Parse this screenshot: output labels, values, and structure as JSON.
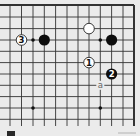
{
  "diagram": {
    "type": "go-board-fragment",
    "corner": "top-right",
    "grid": {
      "columns_x": [
        10,
        21.5,
        33,
        44.3,
        55.6,
        67,
        78,
        89,
        100.3,
        111.6,
        123,
        134
      ],
      "rows_y": [
        5,
        17,
        28.6,
        40,
        51.3,
        62.6,
        74,
        85.3,
        96.6,
        108,
        119.3
      ],
      "edge_top": true,
      "edge_right": true,
      "line_color": "#333333",
      "board_color": "#ebebeb"
    },
    "star_points": [
      {
        "col": 2,
        "row": 3
      },
      {
        "col": 8,
        "row": 3
      },
      {
        "col": 2,
        "row": 9
      },
      {
        "col": 8,
        "row": 9
      }
    ],
    "stones": [
      {
        "color": "white",
        "col": 7,
        "row": 2,
        "label": ""
      },
      {
        "color": "black",
        "col": 3,
        "row": 3,
        "label": ""
      },
      {
        "color": "black",
        "col": 9,
        "row": 3,
        "label": ""
      },
      {
        "color": "white",
        "col": 1,
        "row": 3,
        "label": "3"
      },
      {
        "color": "white",
        "col": 7,
        "row": 5,
        "label": "1"
      },
      {
        "color": "black",
        "col": 9,
        "row": 6,
        "label": "2"
      }
    ],
    "markers": [
      {
        "col": 8,
        "row": 7,
        "label": "a"
      }
    ]
  }
}
